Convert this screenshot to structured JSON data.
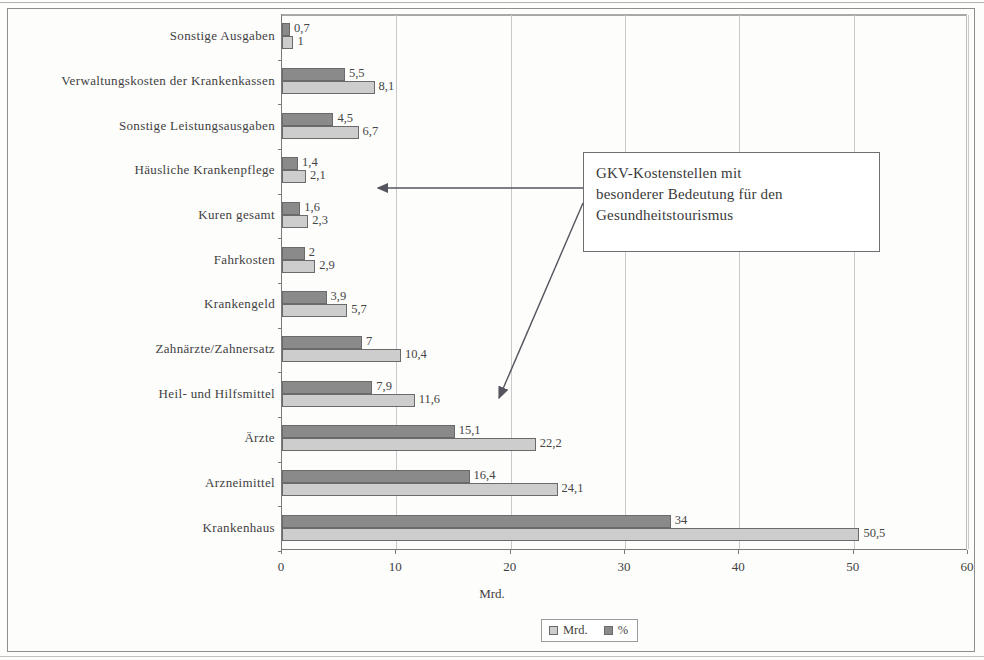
{
  "chart_data": {
    "type": "bar",
    "orientation": "horizontal",
    "title": "",
    "xlabel": "Mrd.",
    "ylabel": "",
    "xlim": [
      0,
      60
    ],
    "xticks": [
      0,
      10,
      20,
      30,
      40,
      50,
      60
    ],
    "grid": "vertical",
    "legend_position": "bottom",
    "categories": [
      "Sonstige Ausgaben",
      "Verwaltungskosten der Krankenkassen",
      "Sonstige Leistungsausgaben",
      "Häusliche Krankenpflege",
      "Kuren gesamt",
      "Fahrkosten",
      "Krankengeld",
      "Zahnärzte/Zahnersatz",
      "Heil- und Hilfsmittel",
      "Ärzte",
      "Arzneimittel",
      "Krankenhaus"
    ],
    "series": [
      {
        "name": "%",
        "color": "#8a8a8a",
        "values": [
          0.7,
          5.5,
          4.5,
          1.4,
          1.6,
          2,
          3.9,
          7,
          7.9,
          15.1,
          16.4,
          34
        ],
        "labels": [
          "0,7",
          "5,5",
          "4,5",
          "1,4",
          "1,6",
          "2",
          "3,9",
          "7",
          "7,9",
          "15,1",
          "16,4",
          "34"
        ]
      },
      {
        "name": "Mrd.",
        "color": "#cdcdcd",
        "values": [
          1,
          8.1,
          6.7,
          2.1,
          2.3,
          2.9,
          5.7,
          10.4,
          11.6,
          22.2,
          24.1,
          50.5
        ],
        "labels": [
          "1",
          "8,1",
          "6,7",
          "2,1",
          "2,3",
          "2,9",
          "5,7",
          "10,4",
          "11,6",
          "22,2",
          "24,1",
          "50,5"
        ]
      }
    ],
    "annotations": [
      {
        "text": "GKV-Kostenstellen mit\nbesonderer Bedeutung für den\nGesundheitstourismus",
        "points_to": [
          "Häusliche Krankenpflege",
          "Heil- und Hilfsmittel"
        ]
      }
    ]
  },
  "legend": {
    "items": [
      {
        "label": "Mrd.",
        "swatch": "mrd"
      },
      {
        "label": "%",
        "swatch": "pct"
      }
    ]
  },
  "axis": {
    "x_title": "Mrd.",
    "tick_labels": [
      "0",
      "10",
      "20",
      "30",
      "40",
      "50",
      "60"
    ]
  },
  "callout": {
    "text": "GKV-Kostenstellen mit\nbesonderer Bedeutung für den\nGesundheitstourismus"
  },
  "colors": {
    "series_pct": "#8a8a8a",
    "series_mrd": "#cdcdcd",
    "axis": "#7a7a7a",
    "grid": "#c9c9c9",
    "text": "#3f3f3f"
  }
}
